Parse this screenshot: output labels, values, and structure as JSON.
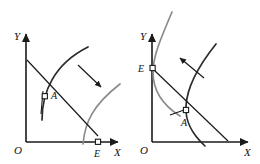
{
  "figure": {
    "background_color": "#ffffff",
    "width": 260,
    "height": 164
  },
  "style": {
    "axis_color": "#1a1a1a",
    "budget_line_color": "#1a1a1a",
    "curve_initial_color": "#2b2b2b",
    "curve_shifted_color": "#8c8c8c",
    "arrow_color": "#1a1a1a",
    "marker_fill": "#ffffff",
    "marker_stroke": "#1a1a1a",
    "tangent_color": "#1a1a1a"
  },
  "panels": [
    {
      "id": "left-panel",
      "name": "left-panel",
      "axes": {
        "x_label": "X",
        "y_label": "Y",
        "origin_label": "O"
      },
      "points": [
        {
          "id": "A",
          "label": "A",
          "marker": "open-square",
          "x": 45,
          "y": 97,
          "description": "tangency point of budget line and initial indifference curve"
        },
        {
          "id": "E",
          "label": "E",
          "marker": "open-square",
          "x": 98,
          "y": 136,
          "description": "budget line intercept on X axis, shifted curve passes through it"
        }
      ],
      "curves": [
        {
          "id": "initial-curve",
          "label": "initial indifference curve",
          "color": "#2b2b2b",
          "passes_through": "A"
        },
        {
          "id": "shifted-curve",
          "label": "shifted indifference curve",
          "color": "#8c8c8c",
          "passes_through": "E"
        }
      ],
      "budget_line": {
        "id": "budget-line",
        "from": "Y-axis intercept",
        "to": "E"
      },
      "tangent_mark": {
        "id": "tangent-at-A",
        "at": "A"
      },
      "arrow": {
        "id": "shift-arrow",
        "direction": "down-right",
        "meaning": "curve shifts outward / downward-right"
      }
    },
    {
      "id": "right-panel",
      "name": "right-panel",
      "axes": {
        "x_label": "X",
        "y_label": "Y",
        "origin_label": "O"
      },
      "points": [
        {
          "id": "E",
          "label": "E",
          "marker": "open-square",
          "x": 152,
          "y": 68,
          "description": "budget line intercept on Y axis, shifted curve passes through it"
        },
        {
          "id": "A",
          "label": "A",
          "marker": "open-square",
          "x": 186,
          "y": 110,
          "description": "tangency point of budget line and initial indifference curve"
        }
      ],
      "curves": [
        {
          "id": "initial-curve",
          "label": "initial indifference curve",
          "color": "#2b2b2b",
          "passes_through": "A"
        },
        {
          "id": "shifted-curve",
          "label": "shifted indifference curve",
          "color": "#8c8c8c",
          "passes_through": "E"
        }
      ],
      "budget_line": {
        "id": "budget-line",
        "from": "E",
        "to": "X-axis intercept"
      },
      "tangent_mark": {
        "id": "tangent-at-A",
        "at": "A"
      },
      "arrow": {
        "id": "shift-arrow",
        "direction": "up-left",
        "meaning": "curve shifts inward / upward-left"
      }
    }
  ],
  "labels": {
    "left": {
      "origin": "O",
      "x_axis": "X",
      "y_axis": "Y",
      "point_a": "A",
      "point_e": "E"
    },
    "right": {
      "origin": "O",
      "x_axis": "X",
      "y_axis": "Y",
      "point_a": "A",
      "point_e": "E"
    }
  }
}
